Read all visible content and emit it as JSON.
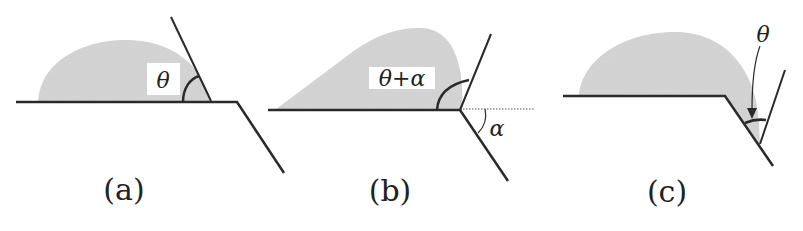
{
  "figure": {
    "colors": {
      "drop_fill": "#d4d4d4",
      "line": "#2a2a2a",
      "background": "#ffffff"
    },
    "panels": [
      {
        "id": "a",
        "caption": "(a)",
        "angle_label": "θ"
      },
      {
        "id": "b",
        "caption": "(b)",
        "angle_label": "θ+α",
        "edge_angle_label": "α"
      },
      {
        "id": "c",
        "caption": "(c)",
        "angle_label": "θ"
      }
    ]
  }
}
